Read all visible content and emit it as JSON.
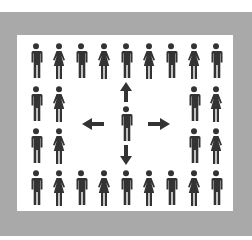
{
  "diagram": {
    "colors": {
      "frame": "#a9a9a9",
      "panel": "#ffffff",
      "figure": "#333333"
    },
    "icon_types": {
      "man": "man-icon",
      "woman": "woman-icon",
      "arrow": "arrow-icon"
    },
    "ring": {
      "top_row": [
        "man",
        "woman",
        "man",
        "woman",
        "man",
        "woman",
        "man",
        "woman",
        "man"
      ],
      "bottom_row": [
        "man",
        "woman",
        "man",
        "woman",
        "man",
        "woman",
        "man",
        "woman",
        "man"
      ],
      "left_column": [
        [
          "man",
          "woman"
        ],
        [
          "man",
          "woman"
        ]
      ],
      "right_column": [
        [
          "man",
          "woman"
        ],
        [
          "man",
          "woman"
        ]
      ]
    },
    "center": {
      "figure": "man",
      "arrows": [
        "up",
        "down",
        "left",
        "right"
      ]
    }
  }
}
